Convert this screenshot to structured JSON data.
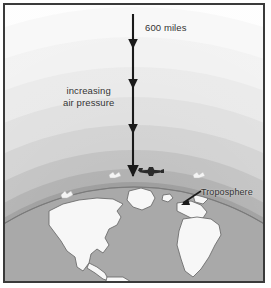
{
  "figure": {
    "type": "science-diagram",
    "border_color": "#3a3a3a",
    "background_color": "#fdfdfd"
  },
  "labels": {
    "altitude": "600 miles",
    "pressure_line1": "increasing",
    "pressure_line2": "air pressure",
    "troposphere": "Troposphere"
  },
  "annotations": {
    "arrow_direction": "downward",
    "arrow_color": "#1a1a1a",
    "arrowhead_count": 4
  },
  "atmosphere": {
    "band_colors": [
      "#fbfbfb",
      "#f1f1f1",
      "#e4e4e4",
      "#d6d6d6",
      "#c4c4c4",
      "#b0b0b0",
      "#9e9e9e",
      "#8f8f8f"
    ],
    "band_labels": [
      "exosphere",
      "thermosphere-outer",
      "thermosphere",
      "mesosphere-outer",
      "mesosphere",
      "stratosphere-outer",
      "stratosphere",
      "troposphere"
    ]
  },
  "earth": {
    "ocean_color": "#a9a9a9",
    "land_color": "#f7f7f7",
    "land_outline_color": "#6e6e6e",
    "continents": [
      "North America",
      "South America",
      "Greenland",
      "Europe",
      "Africa",
      "Iceland"
    ]
  },
  "objects": {
    "airplane_label": "airplane",
    "airplane_color": "#2b2b2b",
    "bird_label": "bird",
    "bird_color": "#f2f2f2",
    "bird_count": 3
  }
}
